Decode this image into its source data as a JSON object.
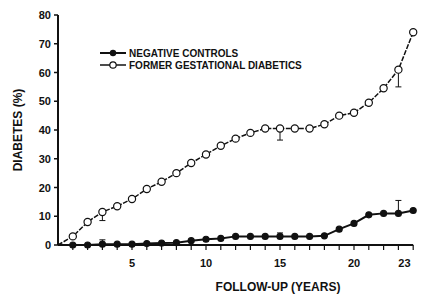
{
  "chart_data": {
    "type": "line",
    "title": "",
    "xlabel": "FOLLOW-UP (YEARS)",
    "ylabel": "DIABETES (%)",
    "ylim": [
      0,
      80
    ],
    "yticks": [
      0,
      10,
      20,
      30,
      40,
      50,
      60,
      70,
      80
    ],
    "xtick_labels": [
      {
        "x": 5,
        "label": "5"
      },
      {
        "x": 10,
        "label": "10"
      },
      {
        "x": 15,
        "label": "15"
      },
      {
        "x": 20,
        "label": "20"
      },
      {
        "x": 23,
        "label": "23"
      }
    ],
    "x": [
      1,
      2,
      3,
      4,
      5,
      6,
      7,
      8,
      9,
      10,
      11,
      12,
      13,
      14,
      15,
      16,
      17,
      18,
      19,
      20,
      21,
      22,
      23,
      24
    ],
    "series": [
      {
        "name": "NEGATIVE CONTROLS",
        "marker": "filled-circle",
        "values": [
          0,
          0,
          0.3,
          0.3,
          0.3,
          0.5,
          0.7,
          0.8,
          1.5,
          2,
          2.3,
          3,
          3,
          3,
          3,
          3,
          3,
          3.2,
          5.5,
          7.5,
          10.5,
          11,
          11,
          12
        ],
        "error_bars": [
          {
            "x": 3,
            "plus": 1.5
          },
          {
            "x": 15,
            "plus": 1.2
          },
          {
            "x": 23,
            "plus": 4.5
          }
        ]
      },
      {
        "name": "FORMER GESTATIONAL DIABETICS",
        "marker": "open-circle",
        "values": [
          3,
          8,
          11.5,
          13.5,
          16,
          19.5,
          22,
          25,
          28.5,
          31.5,
          34.5,
          37,
          39,
          40.5,
          40.5,
          40.5,
          40.5,
          42,
          45,
          46,
          49.5,
          54.5,
          61,
          74
        ],
        "error_bars": [
          {
            "x": 3,
            "minus": 3
          },
          {
            "x": 15,
            "minus": 4
          },
          {
            "x": 23,
            "minus": 6
          }
        ]
      }
    ],
    "legend_position": "upper-left"
  },
  "legend": {
    "neg": "NEGATIVE CONTROLS",
    "gdm": "FORMER GESTATIONAL DIABETICS"
  },
  "axes": {
    "xlabel": "FOLLOW-UP (YEARS)",
    "ylabel": "DIABETES (%)"
  }
}
